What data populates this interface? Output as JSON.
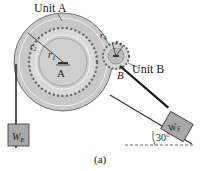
{
  "figure": {
    "caption": "(a)",
    "unit_a": {
      "label": "Unit A",
      "center_label": "A",
      "radii": [
        "r1",
        "r2"
      ]
    },
    "unit_b": {
      "label": "Unit B",
      "center_label": "B",
      "radii": [
        "r3",
        "r4"
      ]
    },
    "weights": {
      "left": "W",
      "left_sub": "E",
      "right": "W",
      "right_sub": "F"
    },
    "incline": {
      "angle": "30°"
    },
    "colors": {
      "disk_fill": "#c8c8c8",
      "gear_fill": "#d9d9d9",
      "block_fill": "#a8a8a8",
      "line": "#333333",
      "rope": "#2a2a2a"
    }
  }
}
